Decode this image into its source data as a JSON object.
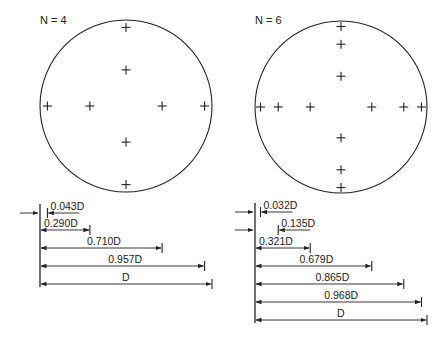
{
  "figure": {
    "panels": [
      {
        "id": "n4",
        "label": "N = 4",
        "circle": {
          "cx": 126,
          "cy": 106,
          "r": 86
        },
        "traverse_positions": [
          0.043,
          0.29,
          0.71,
          0.957
        ],
        "dimensions": [
          {
            "label": "0.043D",
            "fraction": 0.043,
            "from": "right",
            "y": 213
          },
          {
            "label": "0.290D",
            "fraction": 0.29,
            "from": "left",
            "y": 230
          },
          {
            "label": "0.710D",
            "fraction": 0.71,
            "from": "left",
            "y": 248
          },
          {
            "label": "0.957D",
            "fraction": 0.957,
            "from": "left",
            "y": 266
          },
          {
            "label": "D",
            "fraction": 1.0,
            "from": "left",
            "y": 284
          }
        ],
        "entry_arrows": [
          213
        ]
      },
      {
        "id": "n6",
        "label": "N = 6",
        "circle": {
          "cx": 341,
          "cy": 107,
          "r": 86
        },
        "traverse_positions": [
          0.032,
          0.135,
          0.321,
          0.679,
          0.865,
          0.968
        ],
        "dimensions": [
          {
            "label": "0.032D",
            "fraction": 0.032,
            "from": "right",
            "y": 212
          },
          {
            "label": "0.135D",
            "fraction": 0.135,
            "from": "right",
            "y": 230
          },
          {
            "label": "0.321D",
            "fraction": 0.321,
            "from": "left",
            "y": 248
          },
          {
            "label": "0.679D",
            "fraction": 0.679,
            "from": "left",
            "y": 266
          },
          {
            "label": "0.865D",
            "fraction": 0.865,
            "from": "left",
            "y": 284
          },
          {
            "label": "0.968D",
            "fraction": 0.968,
            "from": "left",
            "y": 302
          },
          {
            "label": "D",
            "fraction": 1.0,
            "from": "left",
            "y": 320
          }
        ],
        "entry_arrows": [
          212,
          230
        ]
      }
    ],
    "colors": {
      "line": "#222222",
      "background": "#ffffff"
    }
  }
}
